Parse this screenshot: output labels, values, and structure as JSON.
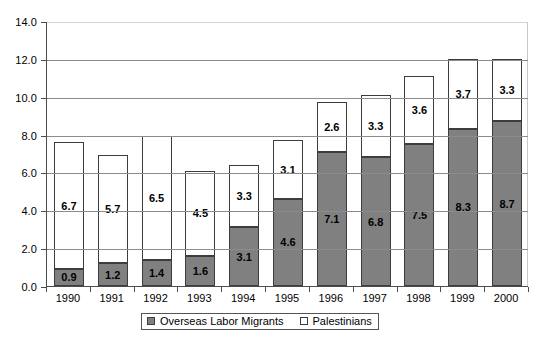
{
  "chart_data": {
    "type": "bar",
    "subtype": "stacked-bar",
    "title": "",
    "xlabel": "",
    "ylabel": "",
    "ylim": [
      0.0,
      14.0
    ],
    "ytick_step": 2.0,
    "ytick_labels": [
      "0.0",
      "2.0",
      "4.0",
      "6.0",
      "8.0",
      "10.0",
      "12.0",
      "14.0"
    ],
    "ytick_values": [
      0.0,
      2.0,
      4.0,
      6.0,
      8.0,
      10.0,
      12.0,
      14.0
    ],
    "grid": true,
    "legend_position": "bottom-center",
    "categories": [
      "1990",
      "1991",
      "1992",
      "1993",
      "1994",
      "1995",
      "1996",
      "1997",
      "1998",
      "1999",
      "2000"
    ],
    "series": [
      {
        "name": "Overseas Labor Migrants",
        "color": "#808080",
        "values": [
          0.9,
          1.2,
          1.4,
          1.6,
          3.1,
          4.6,
          7.1,
          6.8,
          7.5,
          8.3,
          8.7
        ],
        "labels": [
          "0.9",
          "1.2",
          "1.4",
          "1.6",
          "3.1",
          "4.6",
          "7.1",
          "6.8",
          "7.5",
          "8.3",
          "8.7"
        ]
      },
      {
        "name": "Palestinians",
        "color": "#ffffff",
        "values": [
          6.7,
          5.7,
          6.5,
          4.5,
          3.3,
          3.1,
          2.6,
          3.3,
          3.6,
          3.7,
          3.3
        ],
        "labels": [
          "6.7",
          "5.7",
          "6.5",
          "4.5",
          "3.3",
          "3.1",
          "2.6",
          "3.3",
          "3.6",
          "3.7",
          "3.3"
        ]
      }
    ],
    "totals": [
      7.6,
      6.9,
      7.9,
      6.1,
      6.4,
      7.7,
      9.7,
      10.1,
      11.1,
      12.0,
      12.0
    ]
  },
  "legend": {
    "items": [
      {
        "label": "Overseas Labor Migrants",
        "swatch": "filled"
      },
      {
        "label": "Palestinians",
        "swatch": "hollow"
      }
    ]
  }
}
